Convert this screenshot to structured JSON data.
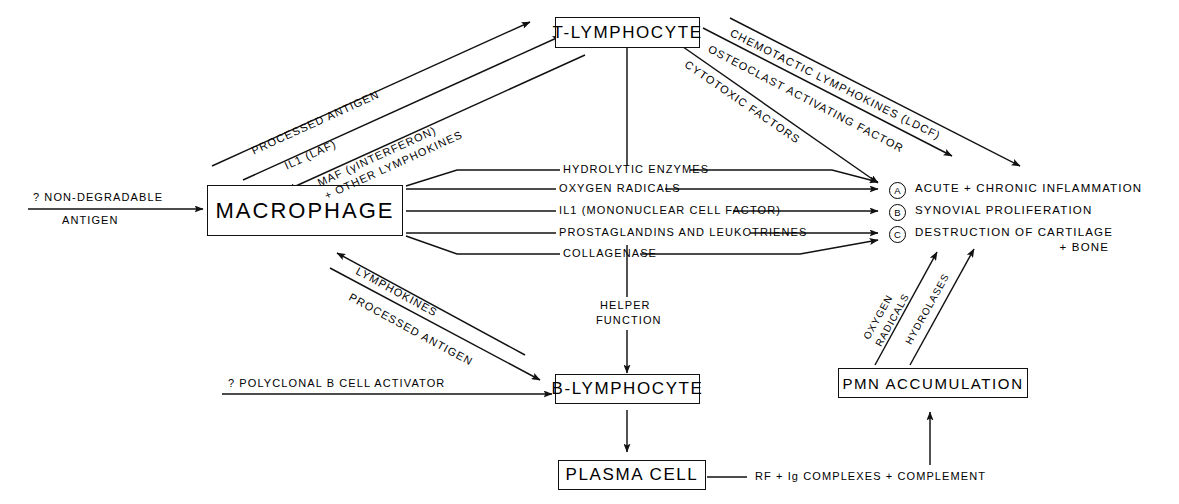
{
  "diagram": {
    "stroke_color": "#111111",
    "background": "#ffffff"
  },
  "nodes": [
    {
      "id": "macrophage",
      "label": "MACROPHAGE"
    },
    {
      "id": "t_lymphocyte",
      "label": "T-LYMPHOCYTE"
    },
    {
      "id": "b_lymphocyte",
      "label": "B-LYMPHOCYTE"
    },
    {
      "id": "plasma_cell",
      "label": "PLASMA CELL"
    },
    {
      "id": "pmn_accumulation",
      "label": "PMN ACCUMULATION"
    }
  ],
  "inputs": [
    {
      "id": "non_degradable_antigen",
      "line1": "? NON-DEGRADABLE",
      "line2": "ANTIGEN"
    },
    {
      "id": "polyclonal_b_cell_activator",
      "label": "? POLYCLONAL B CELL ACTIVATOR"
    }
  ],
  "macrophage_to_t": [
    {
      "id": "processed-antigen-to-t",
      "label": "PROCESSED ANTIGEN"
    },
    {
      "id": "il1-laf",
      "label": "IL1 (LAF)"
    }
  ],
  "t_to_macrophage": [
    {
      "id": "maf-interferon",
      "line1": "MAF (γINTERFERON)",
      "line2": "+ OTHER LYMPHOKINES"
    }
  ],
  "t_to_outcomes": [
    {
      "id": "chemotactic-lymphokines",
      "label": "CHEMOTACTIC LYMPHOKINES (LDCF)"
    },
    {
      "id": "osteoclast-activating-factor",
      "label": "OSTEOCLAST ACTIVATING FACTOR"
    },
    {
      "id": "cytotoxic-factors",
      "label": "CYTOTOXIC FACTORS"
    }
  ],
  "macrophage_mediators": [
    {
      "id": "hydrolytic-enzymes",
      "label": "HYDROLYTIC ENZYMES",
      "target": "A"
    },
    {
      "id": "oxygen-radicals",
      "label": "OXYGEN RADICALS",
      "target": "A"
    },
    {
      "id": "il1-mononuclear-cell-factor",
      "label": "IL1 (MONONUCLEAR CELL FACTOR)",
      "target": "B"
    },
    {
      "id": "prostaglandins-leukotrienes",
      "label": "PROSTAGLANDINS AND LEUKOTRIENES",
      "target": "C"
    },
    {
      "id": "collagenase",
      "label": "COLLAGENASE",
      "target": "C"
    }
  ],
  "macrophage_b_axis": [
    {
      "id": "lymphokines",
      "label": "LYMPHOKINES"
    },
    {
      "id": "processed-antigen-to-b",
      "label": "PROCESSED ANTIGEN"
    }
  ],
  "helper": {
    "line1": "HELPER",
    "line2": "FUNCTION"
  },
  "pmn_mediators": [
    {
      "id": "oxygen-radicals-pmn",
      "line1": "OXYGEN",
      "line2": "RADICALS"
    },
    {
      "id": "hydrolases-pmn",
      "line1": "HYDROLASES",
      "line2": ""
    }
  ],
  "plasma_cell_output": {
    "label": "RF + Ig COMPLEXES + COMPLEMENT"
  },
  "outcomes": [
    {
      "id": "outcome-a",
      "marker": "A",
      "label": "ACUTE + CHRONIC INFLAMMATION",
      "sub": ""
    },
    {
      "id": "outcome-b",
      "marker": "B",
      "label": "SYNOVIAL PROLIFERATION",
      "sub": ""
    },
    {
      "id": "outcome-c",
      "marker": "C",
      "label": "DESTRUCTION OF CARTILAGE",
      "sub": "+ BONE"
    }
  ]
}
